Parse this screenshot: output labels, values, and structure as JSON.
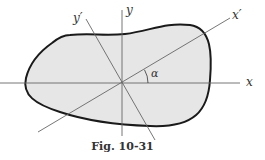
{
  "figure": {
    "caption": "Fig. 10-31",
    "labels": {
      "x_axis": "x",
      "y_axis": "y",
      "x_prime_axis": "x′",
      "y_prime_axis": "y′",
      "angle": "α"
    },
    "colors": {
      "shape_fill": "#e6e6e6",
      "shape_stroke": "#1a1a1a",
      "axis_stroke": "#666666",
      "background": "#ffffff"
    }
  }
}
